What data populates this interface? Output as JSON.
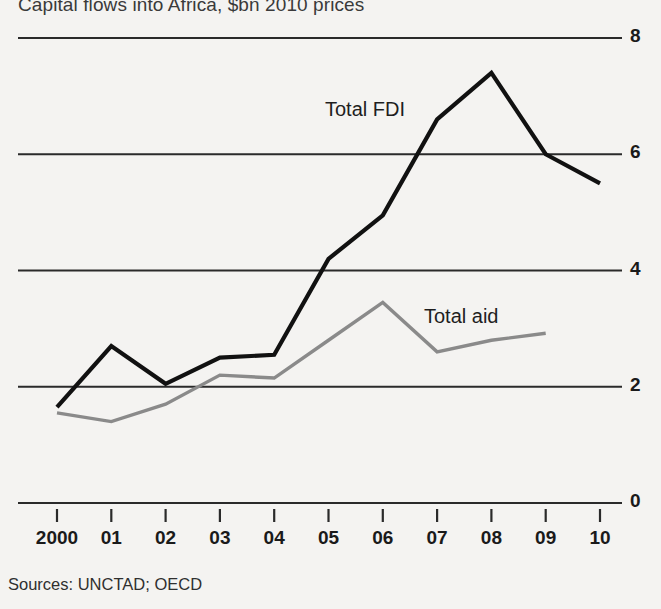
{
  "chart_data": {
    "type": "line",
    "title": "Capital flows into Africa, $bn 2010 prices",
    "subtitle": "",
    "xlabel": "",
    "ylabel": "",
    "source": "Sources: UNCTAD; OECD",
    "categories": [
      "2000",
      "01",
      "02",
      "03",
      "04",
      "05",
      "06",
      "07",
      "08",
      "09",
      "10"
    ],
    "x_tick_labels": [
      "2000",
      "01",
      "02",
      "03",
      "04",
      "05",
      "06",
      "07",
      "08",
      "09",
      "10"
    ],
    "y_tick_labels": [
      "0",
      "2",
      "4",
      "6",
      "8"
    ],
    "y_ticks": [
      0,
      2,
      4,
      6,
      8
    ],
    "ylim": [
      0,
      8
    ],
    "grid": true,
    "grid_axis": "y",
    "legend_position": "inline-annotations",
    "series": [
      {
        "name": "Total FDI",
        "color": "#111111",
        "label_text": "Total FDI",
        "values": [
          1.65,
          2.7,
          2.05,
          2.5,
          2.55,
          4.2,
          4.95,
          6.6,
          7.4,
          6.0,
          5.5
        ]
      },
      {
        "name": "Total aid",
        "color": "#8a8a8a",
        "label_text": "Total aid",
        "values": [
          1.55,
          1.4,
          1.7,
          2.2,
          2.15,
          2.8,
          3.45,
          2.6,
          2.8,
          2.92,
          null
        ]
      }
    ],
    "annotations": [
      {
        "text": "Total FDI",
        "x": 325,
        "y": 98
      },
      {
        "text": "Total aid",
        "x": 424,
        "y": 305
      }
    ],
    "colors": {
      "background": "#f4f3f1",
      "gridline": "#2a2a2a",
      "fdi": "#111111",
      "aid": "#8a8a8a",
      "text": "#1a1a1a"
    }
  }
}
